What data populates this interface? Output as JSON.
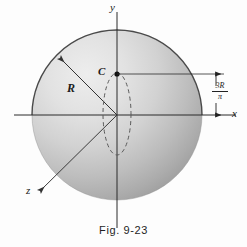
{
  "figure": {
    "caption": "Fig. 9-23",
    "title_hidden": "",
    "axes": {
      "y_label": "y",
      "x_label": "x",
      "z_label": "z"
    },
    "annotations": {
      "radius_label": "R",
      "centroid_label": "C",
      "dimension_numerator": "3R",
      "dimension_denominator": "π"
    },
    "colors": {
      "sphere_light": "#e9e9e9",
      "sphere_mid": "#c9c9c9",
      "sphere_dark": "#a8a8a8",
      "outline": "#4a4a4a",
      "axis": "#2b2b2b",
      "dashed": "#5a5a5a",
      "background": "#fdfdfd",
      "text": "#1b1b1b"
    },
    "geometry": {
      "origin_x": 117,
      "origin_y": 115,
      "sphere_radius": 85,
      "centroid_x": 117,
      "centroid_y": 74,
      "ellipse_rx": 14,
      "ellipse_ry": 41,
      "dimension_top_y": 74,
      "dimension_bottom_y": 115,
      "dimension_x": 216
    }
  }
}
